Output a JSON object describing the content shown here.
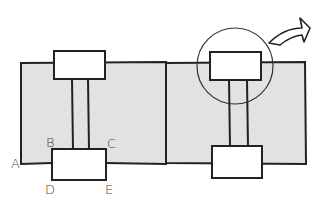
{
  "diagram": {
    "labels": {
      "a": "A",
      "b": "B",
      "c": "C",
      "d": "D",
      "e": "E"
    },
    "colors": {
      "panel_fill": "#e2e2e2",
      "box_fill": "#ffffff",
      "stroke": "#222222"
    }
  }
}
